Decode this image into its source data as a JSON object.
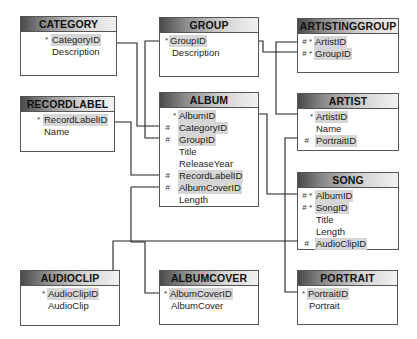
{
  "diagram": {
    "entities": {
      "category": {
        "title": "CATEGORY",
        "attrs": [
          {
            "mark": "*",
            "name": "CategoryID",
            "key": true
          },
          {
            "mark": "",
            "name": "Description",
            "key": false
          }
        ]
      },
      "group": {
        "title": "GROUP",
        "attrs": [
          {
            "mark": "*",
            "name": "GroupID",
            "key": true
          },
          {
            "mark": "",
            "name": "Description",
            "key": false
          }
        ]
      },
      "artistinggroup": {
        "title": "ARTISTINGGROUP",
        "attrs": [
          {
            "mark": "# *",
            "name": "ArtistID",
            "key": true
          },
          {
            "mark": "# *",
            "name": "GroupID",
            "key": true
          }
        ]
      },
      "recordlabel": {
        "title": "RECORDLABEL",
        "attrs": [
          {
            "mark": "*",
            "name": "RecordLabelID",
            "key": true
          },
          {
            "mark": "",
            "name": "Name",
            "key": false
          }
        ]
      },
      "album": {
        "title": "ALBUM",
        "attrs": [
          {
            "mark": "*",
            "name": "AlbumID",
            "key": true
          },
          {
            "mark": "#",
            "name": "CategoryID",
            "key": true
          },
          {
            "mark": "#",
            "name": "GroupID",
            "key": true
          },
          {
            "mark": "",
            "name": "Title",
            "key": false
          },
          {
            "mark": "",
            "name": "ReleaseYear",
            "key": false
          },
          {
            "mark": "#",
            "name": "RecordLabelID",
            "key": true
          },
          {
            "mark": "#",
            "name": "AlbumCoverID",
            "key": true
          },
          {
            "mark": "",
            "name": "Length",
            "key": false
          }
        ]
      },
      "artist": {
        "title": "ARTIST",
        "attrs": [
          {
            "mark": "*",
            "name": "ArtistID",
            "key": true
          },
          {
            "mark": "",
            "name": "Name",
            "key": false
          },
          {
            "mark": "#",
            "name": "PortraitID",
            "key": true
          }
        ]
      },
      "song": {
        "title": "SONG",
        "attrs": [
          {
            "mark": "# *",
            "name": "AlbumID",
            "key": true
          },
          {
            "mark": "# *",
            "name": "SongID",
            "key": true
          },
          {
            "mark": "",
            "name": "Title",
            "key": false
          },
          {
            "mark": "",
            "name": "Length",
            "key": false
          },
          {
            "mark": "#",
            "name": "AudioClipID",
            "key": true
          }
        ]
      },
      "audioclip": {
        "title": "AUDIOCLIP",
        "attrs": [
          {
            "mark": "*",
            "name": "AudioClipID",
            "key": true
          },
          {
            "mark": "",
            "name": "AudioClip",
            "key": false
          }
        ]
      },
      "albumcover": {
        "title": "ALBUMCOVER",
        "attrs": [
          {
            "mark": "*",
            "name": "AlbumCoverID",
            "key": true
          },
          {
            "mark": "",
            "name": "AlbumCover",
            "key": false
          }
        ]
      },
      "portrait": {
        "title": "PORTRAIT",
        "attrs": [
          {
            "mark": "*",
            "name": "PortraitID",
            "key": true
          },
          {
            "mark": "",
            "name": "Portrait",
            "key": false
          }
        ]
      }
    },
    "relationships": [
      {
        "from": "CATEGORY.CategoryID",
        "to": "ALBUM.CategoryID"
      },
      {
        "from": "GROUP.GroupID",
        "to": "ALBUM.GroupID"
      },
      {
        "from": "GROUP.GroupID",
        "to": "ARTISTINGGROUP.GroupID"
      },
      {
        "from": "ARTIST.ArtistID",
        "to": "ARTISTINGGROUP.ArtistID"
      },
      {
        "from": "RECORDLABEL.RecordLabelID",
        "to": "ALBUM.RecordLabelID"
      },
      {
        "from": "ALBUMCOVER.AlbumCoverID",
        "to": "ALBUM.AlbumCoverID"
      },
      {
        "from": "ALBUM.AlbumID",
        "to": "SONG.AlbumID"
      },
      {
        "from": "AUDIOCLIP.AudioClipID",
        "to": "SONG.AudioClipID"
      },
      {
        "from": "PORTRAIT.PortraitID",
        "to": "ARTIST.PortraitID"
      }
    ]
  }
}
